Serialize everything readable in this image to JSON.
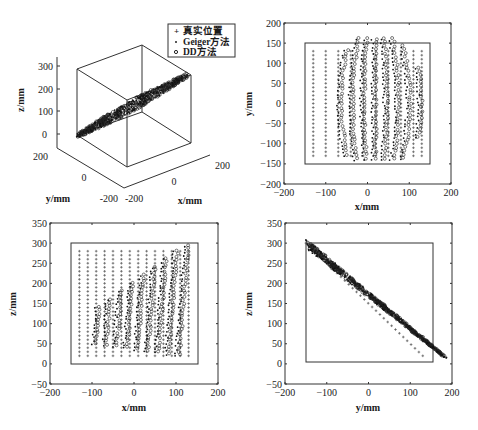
{
  "figure": {
    "legend": {
      "items": [
        {
          "label": "真实位置",
          "marker": "+"
        },
        {
          "label": "Geiger方法",
          "marker": "·"
        },
        {
          "label": "DD方法",
          "marker": "o"
        }
      ]
    }
  },
  "chart_data": [
    {
      "type": "scatter",
      "panel": "3d",
      "title": "",
      "xlabel": "x/mm",
      "ylabel": "y/mm",
      "zlabel": "z/mm",
      "xticks": [
        "-200",
        "0",
        "200"
      ],
      "yticks": [
        "-200",
        "0",
        "200"
      ],
      "zticks": [
        "0",
        "100",
        "200",
        "300"
      ],
      "xlim": [
        -200,
        200
      ],
      "ylim": [
        -200,
        200
      ],
      "zlim": [
        0,
        300
      ],
      "description": "3D view: all points lie on an inclined plane z ≈ 150 - y, forming a dense diagonal band through the cube",
      "legend": [
        "真实位置",
        "Geiger方法",
        "DD方法"
      ],
      "legend_position": "upper right"
    },
    {
      "type": "scatter",
      "panel": "xy",
      "xlabel": "x/mm",
      "ylabel": "y/mm",
      "xlim": [
        -200,
        200
      ],
      "ylim": [
        -200,
        200
      ],
      "xticks": [
        "-200",
        "-100",
        "0",
        "100",
        "200"
      ],
      "yticks": [
        "-200",
        "-150",
        "-100",
        "-50",
        "0",
        "50",
        "100",
        "150",
        "200"
      ],
      "boundary_box": {
        "x": [
          -150,
          150
        ],
        "y": [
          -150,
          150
        ]
      },
      "series": [
        {
          "name": "真实位置",
          "marker": "+",
          "grid_x": [
            -130,
            -100,
            -70,
            -40,
            -10,
            20,
            50,
            80,
            110,
            130
          ],
          "grid_y_range": [
            -130,
            130
          ],
          "grid_y_step": 10
        },
        {
          "name": "Geiger方法",
          "marker": "·",
          "x_range": [
            -90,
            110
          ],
          "y_range": [
            -150,
            180
          ]
        },
        {
          "name": "DD方法",
          "marker": "o",
          "x_range": [
            -70,
            115
          ],
          "y_range": [
            -140,
            165
          ]
        }
      ]
    },
    {
      "type": "scatter",
      "panel": "xz",
      "xlabel": "x/mm",
      "ylabel": "z/mm",
      "xlim": [
        -200,
        200
      ],
      "ylim": [
        -50,
        350
      ],
      "xticks": [
        "-200",
        "-100",
        "0",
        "100",
        "200"
      ],
      "yticks": [
        "-50",
        "0",
        "50",
        "100",
        "150",
        "200",
        "250",
        "300",
        "350"
      ],
      "boundary_box": {
        "x": [
          -150,
          150
        ],
        "z": [
          0,
          300
        ]
      },
      "series": [
        {
          "name": "真实位置",
          "marker": "+",
          "grid_x": [
            -130,
            -110,
            -90,
            -70,
            -50,
            -30,
            -10,
            10,
            30,
            50,
            70,
            90,
            110,
            130
          ],
          "grid_z_range": [
            20,
            280
          ],
          "grid_z_step": 10
        },
        {
          "name": "Geiger方法",
          "marker": "·",
          "x_range": [
            -100,
            110
          ],
          "z_range": [
            20,
            300
          ]
        },
        {
          "name": "DD方法",
          "marker": "o",
          "x_range": [
            -95,
            115
          ],
          "z_range": [
            25,
            290
          ]
        }
      ]
    },
    {
      "type": "scatter",
      "panel": "yz",
      "xlabel": "y/mm",
      "ylabel": "z/mm",
      "xlim": [
        -200,
        200
      ],
      "ylim": [
        -50,
        350
      ],
      "xticks": [
        "-200",
        "-100",
        "0",
        "100",
        "200"
      ],
      "yticks": [
        "-50",
        "0",
        "50",
        "100",
        "150",
        "200",
        "250",
        "300",
        "350"
      ],
      "boundary_box": {
        "y": [
          -150,
          150
        ],
        "z": [
          0,
          300
        ]
      },
      "series": [
        {
          "name": "真实位置",
          "marker": "+",
          "line": {
            "y": [
              -150,
              130
            ],
            "z": [
              300,
              20
            ]
          }
        },
        {
          "name": "Geiger方法",
          "marker": "·",
          "line": {
            "y": [
              -150,
              185
            ],
            "z": [
              300,
              15
            ]
          },
          "spread": 12
        },
        {
          "name": "DD方法",
          "marker": "o",
          "line": {
            "y": [
              -145,
              180
            ],
            "z": [
              295,
              20
            ]
          },
          "spread": 10
        }
      ]
    }
  ]
}
